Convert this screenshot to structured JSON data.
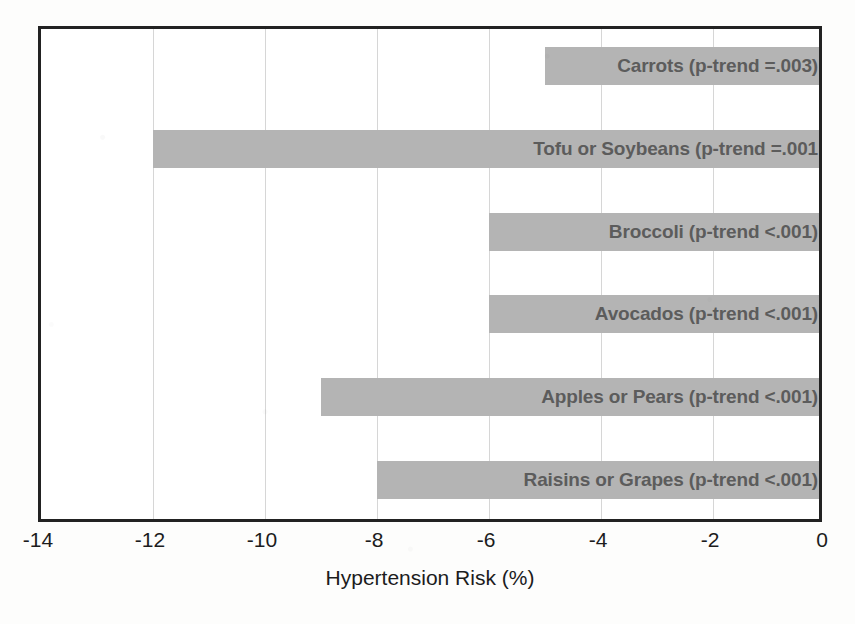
{
  "chart_data": {
    "type": "bar",
    "orientation": "horizontal",
    "title": "",
    "subtitle": "",
    "xlabel": "Hypertension Risk (%)",
    "ylabel": "",
    "xlim": [
      -14,
      0
    ],
    "xticks": [
      -14,
      -12,
      -10,
      -8,
      -6,
      -4,
      -2,
      0
    ],
    "xtick_labels": [
      "-14",
      "-12",
      "-10",
      "-8",
      "-6",
      "-4",
      "-2",
      "0"
    ],
    "grid": true,
    "grid_axis": "x",
    "legend": false,
    "legend_position": "none",
    "categories": [
      "Carrots",
      "Tofu or Soybeans",
      "Broccoli",
      "Avocados",
      "Apples or Pears",
      "Raisins or Grapes"
    ],
    "values": [
      -5.0,
      -12.0,
      -6.0,
      -6.0,
      -9.0,
      -8.0
    ],
    "bar_labels": [
      "Carrots (p-trend =.003)",
      "Tofu or Soybeans (p-trend =.001",
      "Broccoli (p-trend <.001)",
      "Avocados (p-trend <.001)",
      "Apples or Pears (p-trend <.001)",
      "Raisins or Grapes (p-trend <.001)"
    ],
    "annotations": [
      {
        "category": "Carrots",
        "p_trend": "=.003"
      },
      {
        "category": "Tofu or Soybeans",
        "p_trend": "=.001"
      },
      {
        "category": "Broccoli",
        "p_trend": "<.001"
      },
      {
        "category": "Avocados",
        "p_trend": "<.001"
      },
      {
        "category": "Apples or Pears",
        "p_trend": "<.001"
      },
      {
        "category": "Raisins or Grapes",
        "p_trend": "<.001"
      }
    ],
    "colors": {
      "bar_fill": "#b4b4b4",
      "bar_label_text": "#5c5c5c",
      "axis_text": "#1c1c1c",
      "frame": "#222222",
      "gridline": "#d6d6d6",
      "plot_background": "#ffffff",
      "figure_background": "#fdfdfc"
    }
  }
}
